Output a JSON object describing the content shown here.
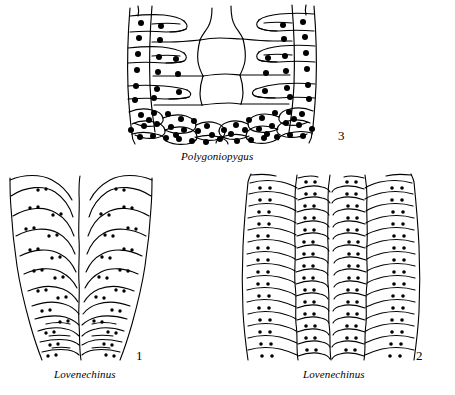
{
  "page": {
    "background_color": "#ffffff",
    "ink_color": "#000000",
    "kind": "scientific-illustration-plate"
  },
  "figures": [
    {
      "id": "fig3",
      "number": "3",
      "caption": "Polygoniopygus",
      "description": "Dense coarse tuberculation; large open polygonal interambulacral plates in center flanked by tuberculate ambulacral columns",
      "tubercle_size": "large",
      "tubercle_count": 96
    },
    {
      "id": "fig1",
      "number": "1",
      "caption": "Lovenechinus",
      "description": "Broad simple ambulacral plates with sparse small tubercles, widening upward",
      "tubercle_size": "small",
      "tubercle_count": 54
    },
    {
      "id": "fig2",
      "number": "2",
      "caption": "Lovenechinus",
      "description": "Narrow crowded horizontal ambulacral plate rows with paired small tubercles",
      "tubercle_size": "small",
      "tubercle_count": 88
    }
  ]
}
